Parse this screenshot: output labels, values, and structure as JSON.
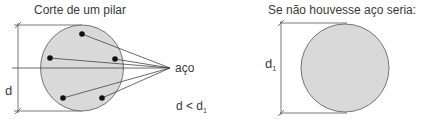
{
  "left_panel": {
    "title": "Corte de um pilar",
    "dimension_label": "d",
    "pointer_label": "aço",
    "comparison": {
      "lhs": "d < d",
      "subscript": "1"
    }
  },
  "right_panel": {
    "title": "Se não houvesse aço seria:",
    "dimension_label": "d",
    "dimension_subscript": "1"
  },
  "colors": {
    "fill": "#d9d9d9",
    "stroke": "#555555",
    "text": "#3a3a3a",
    "dot": "#111111"
  }
}
